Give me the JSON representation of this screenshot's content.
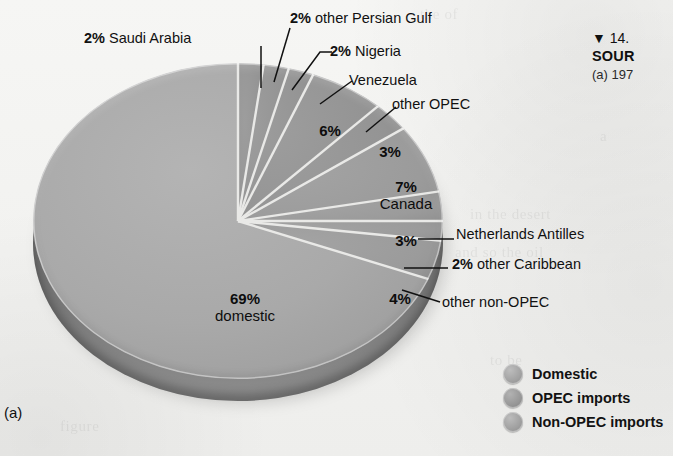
{
  "figure": {
    "panel_label": "(a)",
    "caption_line1": "▼  14.",
    "caption_line2": "SOUR",
    "caption_line3": "(a) 197"
  },
  "legend": {
    "items": [
      {
        "label": "Domestic",
        "swatch_color": "#a2a2a2",
        "icon": "circle-swatch-icon"
      },
      {
        "label": "OPEC imports",
        "swatch_color": "#979797",
        "icon": "circle-swatch-icon"
      },
      {
        "label": "Non-OPEC imports",
        "swatch_color": "#a0a0a0",
        "icon": "circle-swatch-icon"
      }
    ]
  },
  "labels": {
    "saudi_arabia": {
      "pct": "2%",
      "name": "Saudi Arabia"
    },
    "other_persian_gulf": {
      "pct": "2%",
      "name": "other Persian Gulf"
    },
    "nigeria": {
      "pct": "2%",
      "name": "Nigeria"
    },
    "venezuela_name": "Venezuela",
    "venezuela_pct": "6%",
    "other_opec_name": "other OPEC",
    "other_opec_pct": "3%",
    "canada_pct": "7%",
    "canada_name": "Canada",
    "netherlands_antilles_pct": "3%",
    "netherlands_antilles_name": "Netherlands Antilles",
    "other_caribbean": {
      "pct": "2%",
      "name": "other Caribbean"
    },
    "other_non_opec_pct": "4%",
    "other_non_opec_name": "other non-OPEC",
    "domestic_pct": "69%",
    "domestic_name": "domestic"
  },
  "chart_data": {
    "type": "pie",
    "title": "",
    "xlabel": "",
    "ylabel": "",
    "grid": false,
    "legend_position": "bottom-right",
    "units": "percent of total petroleum supply",
    "start_angle_deg": 0,
    "direction": "clockwise",
    "three_d": true,
    "groups": [
      "Domestic",
      "OPEC imports",
      "Non-OPEC imports"
    ],
    "labels": [
      "Saudi Arabia",
      "other Persian Gulf",
      "Nigeria",
      "Venezuela",
      "other OPEC",
      "Canada",
      "Netherlands Antilles",
      "other Caribbean",
      "other non-OPEC",
      "domestic"
    ],
    "values": [
      2,
      2,
      2,
      6,
      3,
      7,
      3,
      2,
      4,
      69
    ],
    "slices": [
      {
        "label": "Saudi Arabia",
        "value": 2,
        "group": "OPEC imports",
        "color": "#949494"
      },
      {
        "label": "other Persian Gulf",
        "value": 2,
        "group": "OPEC imports",
        "color": "#949494"
      },
      {
        "label": "Nigeria",
        "value": 2,
        "group": "OPEC imports",
        "color": "#949494"
      },
      {
        "label": "Venezuela",
        "value": 6,
        "group": "OPEC imports",
        "color": "#949494"
      },
      {
        "label": "other OPEC",
        "value": 3,
        "group": "OPEC imports",
        "color": "#949494"
      },
      {
        "label": "Canada",
        "value": 7,
        "group": "Non-OPEC imports",
        "color": "#9b9b9b"
      },
      {
        "label": "Netherlands Antilles",
        "value": 3,
        "group": "Non-OPEC imports",
        "color": "#9b9b9b"
      },
      {
        "label": "other Caribbean",
        "value": 2,
        "group": "Non-OPEC imports",
        "color": "#9b9b9b"
      },
      {
        "label": "other non-OPEC",
        "value": 4,
        "group": "Non-OPEC imports",
        "color": "#9b9b9b"
      },
      {
        "label": "domestic",
        "value": 69,
        "group": "Domestic",
        "color": "#a9a9a9"
      }
    ],
    "total": 100
  }
}
